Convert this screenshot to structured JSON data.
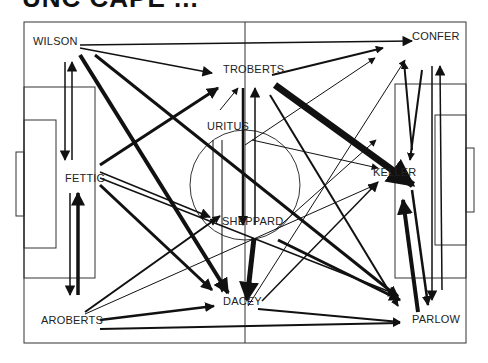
{
  "title": "UNC CAPE ...",
  "colors": {
    "line": "#111111",
    "pitch": "#333333",
    "background": "#ffffff"
  },
  "players": [
    {
      "id": "wilson",
      "label": "WILSON",
      "x": 33,
      "y": 41
    },
    {
      "id": "fettig",
      "label": "FETTIG",
      "x": 65,
      "y": 178
    },
    {
      "id": "aroberts",
      "label": "AROBERTS",
      "x": 41,
      "y": 320
    },
    {
      "id": "troberts",
      "label": "TROBERTS",
      "x": 223,
      "y": 69
    },
    {
      "id": "uritus",
      "label": "URITUS",
      "x": 207,
      "y": 126
    },
    {
      "id": "sheppard",
      "label": "SHEPPARD",
      "x": 222,
      "y": 221
    },
    {
      "id": "dacey",
      "label": "DACEY",
      "x": 223,
      "y": 301
    },
    {
      "id": "confer",
      "label": "CONFER",
      "x": 412,
      "y": 36
    },
    {
      "id": "keller",
      "label": "KELLER",
      "x": 373,
      "y": 172
    },
    {
      "id": "parlow",
      "label": "PARLOW",
      "x": 412,
      "y": 319
    }
  ],
  "passes": [
    {
      "from": [
        80,
        45
      ],
      "to": [
        412,
        41
      ],
      "w": 1.5
    },
    {
      "from": [
        80,
        48
      ],
      "to": [
        212,
        73
      ],
      "w": 1.5
    },
    {
      "from": [
        80,
        55
      ],
      "to": [
        228,
        293
      ],
      "w": 4
    },
    {
      "from": [
        95,
        55
      ],
      "to": [
        398,
        297
      ],
      "w": 3
    },
    {
      "from": [
        72,
        160
      ],
      "to": [
        72,
        62
      ],
      "w": 1.5
    },
    {
      "from": [
        65,
        62
      ],
      "to": [
        65,
        160
      ],
      "w": 1.5
    },
    {
      "from": [
        100,
        165
      ],
      "to": [
        218,
        88
      ],
      "w": 3
    },
    {
      "from": [
        100,
        172
      ],
      "to": [
        210,
        217
      ],
      "w": 1.5
    },
    {
      "from": [
        100,
        178
      ],
      "to": [
        398,
        295
      ],
      "w": 1.5
    },
    {
      "from": [
        100,
        185
      ],
      "to": [
        212,
        290
      ],
      "w": 3
    },
    {
      "from": [
        78,
        295
      ],
      "to": [
        78,
        193
      ],
      "w": 3.5
    },
    {
      "from": [
        70,
        193
      ],
      "to": [
        70,
        295
      ],
      "w": 1.5
    },
    {
      "from": [
        85,
        312
      ],
      "to": [
        220,
        216
      ],
      "w": 2
    },
    {
      "from": [
        85,
        314
      ],
      "to": [
        375,
        185
      ],
      "w": 1
    },
    {
      "from": [
        100,
        320
      ],
      "to": [
        214,
        306
      ],
      "w": 2.5
    },
    {
      "from": [
        100,
        329
      ],
      "to": [
        400,
        323
      ],
      "w": 2
    },
    {
      "from": [
        220,
        110
      ],
      "to": [
        238,
        88
      ],
      "w": 1
    },
    {
      "from": [
        272,
        75
      ],
      "to": [
        383,
        48
      ],
      "w": 2
    },
    {
      "from": [
        275,
        85
      ],
      "to": [
        413,
        185
      ],
      "w": 7
    },
    {
      "from": [
        270,
        95
      ],
      "to": [
        398,
        306
      ],
      "w": 2
    },
    {
      "from": [
        255,
        225
      ],
      "to": [
        255,
        88
      ],
      "w": 1.5
    },
    {
      "from": [
        243,
        88
      ],
      "to": [
        243,
        225
      ],
      "w": 2.5
    },
    {
      "from": [
        213,
        140
      ],
      "to": [
        213,
        225
      ],
      "w": 1
    },
    {
      "from": [
        222,
        140
      ],
      "to": [
        222,
        292
      ],
      "w": 1
    },
    {
      "from": [
        245,
        145
      ],
      "to": [
        375,
        58
      ],
      "w": 1
    },
    {
      "from": [
        252,
        140
      ],
      "to": [
        378,
        168
      ],
      "w": 1
    },
    {
      "from": [
        254,
        238
      ],
      "to": [
        247,
        300
      ],
      "w": 5
    },
    {
      "from": [
        278,
        240
      ],
      "to": [
        400,
        300
      ],
      "w": 3
    },
    {
      "from": [
        275,
        230
      ],
      "to": [
        376,
        140
      ],
      "w": 1
    },
    {
      "from": [
        262,
        301
      ],
      "to": [
        378,
        182
      ],
      "w": 1.5
    },
    {
      "from": [
        248,
        306
      ],
      "to": [
        405,
        60
      ],
      "w": 1
    },
    {
      "from": [
        258,
        309
      ],
      "to": [
        400,
        322
      ],
      "w": 2
    },
    {
      "from": [
        412,
        150
      ],
      "to": [
        404,
        62
      ],
      "w": 2
    },
    {
      "from": [
        422,
        70
      ],
      "to": [
        410,
        160
      ],
      "w": 2
    },
    {
      "from": [
        442,
        290
      ],
      "to": [
        440,
        66
      ],
      "w": 1.5
    },
    {
      "from": [
        432,
        66
      ],
      "to": [
        432,
        300
      ],
      "w": 1.5
    },
    {
      "from": [
        418,
        312
      ],
      "to": [
        403,
        200
      ],
      "w": 4
    },
    {
      "from": [
        412,
        190
      ],
      "to": [
        428,
        305
      ],
      "w": 2.5
    }
  ]
}
